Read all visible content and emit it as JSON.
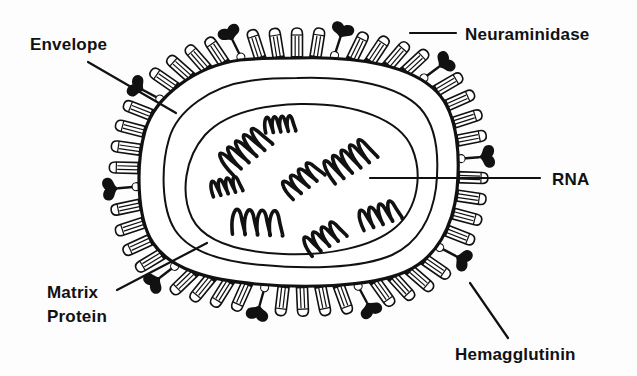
{
  "figure": {
    "background_color": "#fdfdfd",
    "ink_color": "#111111"
  },
  "labels": {
    "envelope": "Envelope",
    "neuraminidase": "Neuraminidase",
    "rna": "RNA",
    "matrix_protein_line1": "Matrix",
    "matrix_protein_line2": "Protein",
    "hemagglutinin": "Hemagglutinin"
  },
  "diagram_data": {
    "type": "diagram",
    "subject": "influenza virion cross-section",
    "structures": [
      {
        "name": "envelope",
        "shape": "rounded-rectangle",
        "description": "outer lipid bilayer membrane of the virion",
        "label": "Envelope"
      },
      {
        "name": "matrix-protein",
        "shape": "band",
        "description": "layer lying just inside the envelope",
        "label": "Matrix Protein"
      },
      {
        "name": "nucleocapsid",
        "shape": "oval",
        "description": "inner compartment enclosing the genome segments"
      },
      {
        "name": "rna",
        "shape": "helical-coils",
        "count": 8,
        "description": "segmented helical ribonucleoprotein strands",
        "label": "RNA"
      },
      {
        "name": "hemagglutinin",
        "shape": "rod-spike",
        "count": 40,
        "description": "cylindrical rod-shaped surface glycoprotein spikes",
        "label": "Hemagglutinin"
      },
      {
        "name": "neuraminidase",
        "shape": "mushroom-spike",
        "count": 10,
        "description": "mushroom-headed surface glycoprotein spikes",
        "label": "Neuraminidase"
      }
    ],
    "rna_segments": [
      {
        "cx": 280,
        "cy": 122,
        "angle": -4,
        "loops": 4,
        "size": "small"
      },
      {
        "cx": 243,
        "cy": 147,
        "angle": -38,
        "loops": 5,
        "size": "large"
      },
      {
        "cx": 348,
        "cy": 157,
        "angle": -32,
        "loops": 5,
        "size": "large"
      },
      {
        "cx": 226,
        "cy": 184,
        "angle": -12,
        "loops": 4,
        "size": "small"
      },
      {
        "cx": 301,
        "cy": 177,
        "angle": -38,
        "loops": 4,
        "size": "medium"
      },
      {
        "cx": 258,
        "cy": 219,
        "angle": 2,
        "loops": 4,
        "size": "large"
      },
      {
        "cx": 379,
        "cy": 212,
        "angle": -18,
        "loops": 4,
        "size": "medium"
      },
      {
        "cx": 323,
        "cy": 235,
        "angle": -30,
        "loops": 4,
        "size": "medium"
      }
    ],
    "leader_lines": [
      {
        "label": "Envelope",
        "from": [
          88,
          62
        ],
        "to": [
          176,
          113
        ]
      },
      {
        "label": "Neuraminidase",
        "from": [
          410,
          33
        ],
        "to": [
          456,
          33
        ]
      },
      {
        "label": "RNA",
        "from": [
          370,
          178
        ],
        "to": [
          540,
          178
        ]
      },
      {
        "label": "Matrix Protein",
        "from": [
          117,
          290
        ],
        "to": [
          207,
          243
        ]
      },
      {
        "label": "Hemagglutinin",
        "from": [
          508,
          338
        ],
        "to": [
          470,
          283
        ]
      }
    ],
    "label_positions": [
      {
        "label": "Envelope",
        "x": 30,
        "y": 50
      },
      {
        "label": "Neuraminidase",
        "x": 465,
        "y": 40
      },
      {
        "label": "RNA",
        "x": 552,
        "y": 185
      },
      {
        "label": "Matrix",
        "x": 47,
        "y": 298
      },
      {
        "label": "Protein",
        "x": 47,
        "y": 322
      },
      {
        "label": "Hemagglutinin",
        "x": 455,
        "y": 360
      }
    ]
  }
}
